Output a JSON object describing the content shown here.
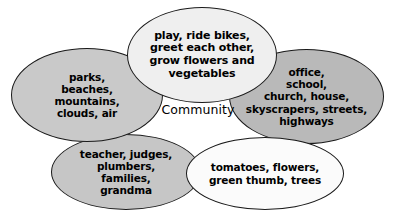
{
  "diagram": {
    "title": "Community",
    "center_label": "Community",
    "type": "overlapping-ellipse-cluster",
    "bubbles": [
      {
        "id": "activities",
        "name": "activities-bubble",
        "label": "play, ride bikes,\ngreet each other,\ngrow flowers and\nvegetables",
        "fill": "#efefef",
        "position": "top"
      },
      {
        "id": "nature",
        "name": "nature-bubble",
        "label": "parks,\nbeaches,\nmountains,\nclouds, air",
        "fill": "#c9c9c9",
        "position": "left"
      },
      {
        "id": "places",
        "name": "places-bubble",
        "label": "office,\nschool,\nchurch, house,\nskyscrapers, streets,\nhighways",
        "fill": "#b9b9b9",
        "position": "right"
      },
      {
        "id": "people",
        "name": "people-bubble",
        "label": "teacher, judges,\nplumbers,\nfamilies,\ngrandma",
        "fill": "#c6c6c6",
        "position": "bottom-left"
      },
      {
        "id": "garden",
        "name": "garden-bubble",
        "label": "tomatoes, flowers,\ngreen thumb, trees",
        "fill": "#fbfbfb",
        "position": "bottom-right"
      }
    ],
    "outline_color": "#1a1a1a",
    "background": "#ffffff"
  }
}
